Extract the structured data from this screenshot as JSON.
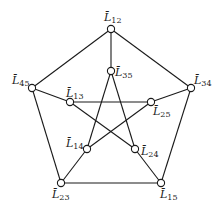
{
  "diagram": {
    "type": "graph",
    "name": "Petersen graph",
    "nodes": [
      {
        "id": "L12",
        "label": "L̄",
        "sub": "12",
        "x": 111,
        "y": 29,
        "lx": 104,
        "ly": 21
      },
      {
        "id": "L35",
        "label": "L̄",
        "sub": "35",
        "x": 111,
        "y": 71,
        "lx": 115,
        "ly": 76
      },
      {
        "id": "L45",
        "label": "L̄",
        "sub": "45",
        "x": 32,
        "y": 88,
        "lx": 12,
        "ly": 84
      },
      {
        "id": "L34",
        "label": "L̄",
        "sub": "34",
        "x": 191,
        "y": 88,
        "lx": 194,
        "ly": 84
      },
      {
        "id": "L13",
        "label": "L̄",
        "sub": "13",
        "x": 70,
        "y": 102,
        "lx": 66,
        "ly": 97
      },
      {
        "id": "L25",
        "label": "L̄",
        "sub": "25",
        "x": 151,
        "y": 102,
        "lx": 153,
        "ly": 115
      },
      {
        "id": "L14",
        "label": "L̄",
        "sub": "14",
        "x": 87,
        "y": 149,
        "lx": 66,
        "ly": 147
      },
      {
        "id": "L24",
        "label": "L̄",
        "sub": "24",
        "x": 135,
        "y": 149,
        "lx": 141,
        "ly": 155
      },
      {
        "id": "L23",
        "label": "L̄",
        "sub": "23",
        "x": 61,
        "y": 183,
        "lx": 52,
        "ly": 198
      },
      {
        "id": "L15",
        "label": "L̄",
        "sub": "15",
        "x": 161,
        "y": 183,
        "lx": 160,
        "ly": 198
      }
    ],
    "edges": [
      [
        "L12",
        "L34"
      ],
      [
        "L34",
        "L15"
      ],
      [
        "L15",
        "L23"
      ],
      [
        "L23",
        "L45"
      ],
      [
        "L45",
        "L12"
      ],
      [
        "L12",
        "L35"
      ],
      [
        "L34",
        "L25"
      ],
      [
        "L15",
        "L24"
      ],
      [
        "L23",
        "L14"
      ],
      [
        "L45",
        "L13"
      ],
      [
        "L35",
        "L14"
      ],
      [
        "L35",
        "L24"
      ],
      [
        "L13",
        "L25"
      ],
      [
        "L13",
        "L24"
      ],
      [
        "L25",
        "L14"
      ]
    ]
  }
}
